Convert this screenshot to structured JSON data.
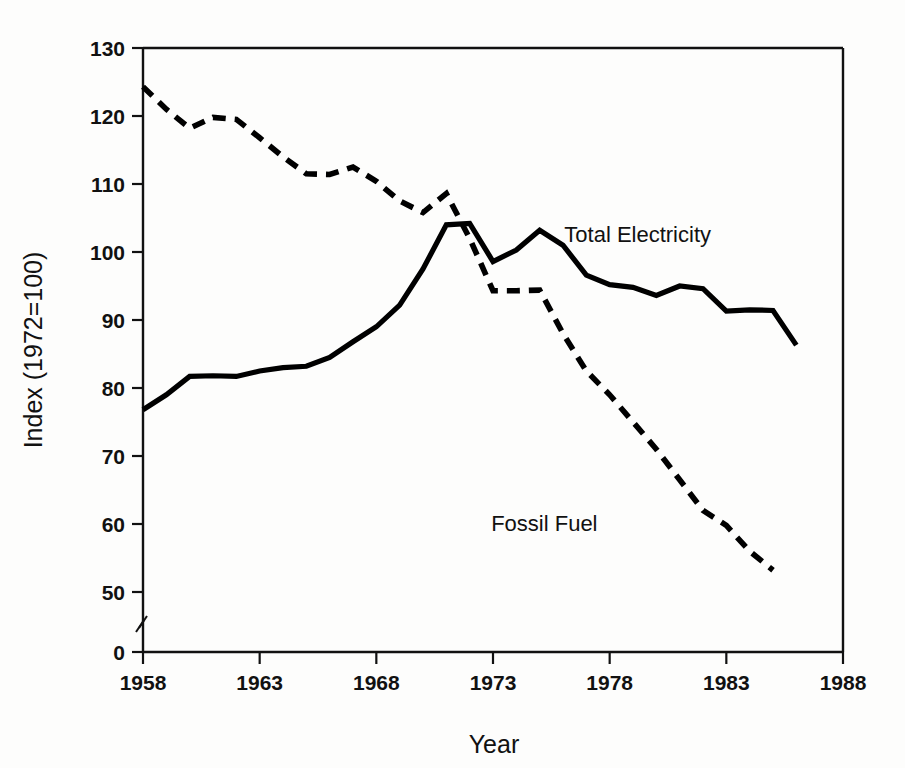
{
  "chart_data": {
    "type": "line",
    "title": "",
    "xlabel": "Year",
    "ylabel": "Index (1972=100)",
    "xlim": [
      1958,
      1988
    ],
    "ylim": [
      50,
      130
    ],
    "y_axis_break": true,
    "y_break_label": "0",
    "grid": false,
    "legend_position": "inline-annotation",
    "xticks": [
      "1958",
      "1963",
      "1968",
      "1973",
      "1978",
      "1983",
      "1988"
    ],
    "xtick_values": [
      1958,
      1963,
      1968,
      1973,
      1978,
      1983,
      1988
    ],
    "yticks": [
      "130",
      "120",
      "110",
      "100",
      "90",
      "80",
      "70",
      "60",
      "50",
      "0"
    ],
    "ytick_values": [
      130,
      120,
      110,
      100,
      90,
      80,
      70,
      60,
      50,
      0
    ],
    "series": [
      {
        "name": "Total Electricity",
        "style": "solid",
        "color": "#000000",
        "label_x": 1979.2,
        "label_y": 101.5,
        "x": [
          1958,
          1959,
          1960,
          1961,
          1962,
          1963,
          1964,
          1965,
          1966,
          1967,
          1968,
          1969,
          1970,
          1971,
          1972,
          1973,
          1974,
          1975,
          1976,
          1977,
          1978,
          1979,
          1980,
          1981,
          1982,
          1983,
          1984,
          1985,
          1986
        ],
        "values": [
          76.8,
          79.0,
          81.7,
          81.8,
          81.7,
          82.5,
          83.0,
          83.2,
          84.5,
          86.8,
          89.0,
          92.2,
          97.5,
          104.0,
          104.2,
          98.6,
          100.3,
          103.2,
          101.0,
          96.6,
          95.2,
          94.8,
          93.6,
          95.0,
          94.6,
          91.3,
          91.5,
          91.4,
          86.3
        ]
      },
      {
        "name": "Fossil Fuel",
        "style": "dashed",
        "color": "#000000",
        "label_x": 1975.2,
        "label_y": 59.0,
        "x": [
          1958,
          1959,
          1960,
          1961,
          1962,
          1963,
          1964,
          1965,
          1966,
          1967,
          1968,
          1969,
          1970,
          1971,
          1972,
          1973,
          1974,
          1975,
          1976,
          1977,
          1978,
          1979,
          1980,
          1981,
          1982,
          1983,
          1984,
          1985
        ],
        "values": [
          124.3,
          121.0,
          118.2,
          119.8,
          119.5,
          116.8,
          114.0,
          111.5,
          111.4,
          112.5,
          110.4,
          107.5,
          105.8,
          108.6,
          102.0,
          94.3,
          94.3,
          94.4,
          88.0,
          82.5,
          79.0,
          75.0,
          71.0,
          66.5,
          62.0,
          59.8,
          56.0,
          53.2
        ]
      }
    ]
  },
  "labels": {
    "total_electricity": "Total Electricity",
    "fossil_fuel": "Fossil Fuel",
    "year_axis": "Year",
    "index_axis": "Index (1972=100)"
  }
}
